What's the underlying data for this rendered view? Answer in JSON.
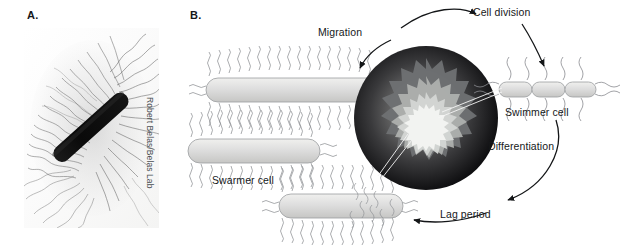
{
  "figure": {
    "panels": [
      {
        "id": "A",
        "label": "A.",
        "type": "micrograph",
        "caption_credit": "Robert Belas/Belas Lab",
        "depicts": "elongated hyperflagellated swarmer cell with dense peritrichous flagella"
      },
      {
        "id": "B",
        "label": "B.",
        "type": "cycle-diagram",
        "depicts": "swarming life cycle around a central swarming colony plate"
      }
    ]
  },
  "panelA": {
    "label": "A.",
    "credit": "Robert Belas/Belas Lab"
  },
  "panelB": {
    "label": "B.",
    "labels": {
      "migration": "Migration",
      "cell_division": "Cell division",
      "swimmer_cell": "Swimmer cell",
      "differentiation": "Differentiation",
      "lag_period": "Lag period",
      "swarmer_cell": "Swarmer cell"
    },
    "cycle_order": [
      "Migration",
      "Cell division",
      "Swimmer cell",
      "Differentiation",
      "Lag period"
    ],
    "elements": {
      "swarmer_cells_count": 3,
      "swimmer_cell_segments": 3,
      "colony_rings": 4
    }
  },
  "colors": {
    "background": "#ffffff",
    "text": "#16181a",
    "credit_text": "#4a4f53",
    "cell_body_fill": "#dcdcda",
    "cell_body_stroke": "#8e9094",
    "flagella": "#8a8c90",
    "arrow": "#141618",
    "colony_outer": "#0a0a0c",
    "colony_mid": "#6d6f72",
    "colony_inner": "#d5d7d6",
    "colony_core": "#f2f3f1"
  }
}
